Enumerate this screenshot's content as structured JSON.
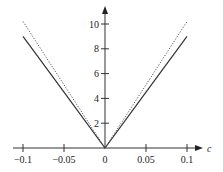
{
  "chart_data": {
    "type": "line",
    "title": "",
    "xlabel": "c",
    "ylabel": "",
    "xlim": [
      -0.11,
      0.12
    ],
    "ylim": [
      0,
      11
    ],
    "grid": false,
    "legend": null,
    "x_ticks": [
      -0.1,
      -0.05,
      0,
      0.05,
      0.1
    ],
    "x_tick_labels": [
      "−0.1",
      "−0.05",
      "0",
      "0.05",
      "0.1"
    ],
    "y_ticks": [
      2,
      4,
      6,
      8,
      10
    ],
    "y_tick_labels": [
      "2",
      "4",
      "6",
      "8",
      "10"
    ],
    "series": [
      {
        "name": "solid",
        "style": "solid",
        "color": "#333333",
        "x": [
          -0.1,
          -0.05,
          0,
          0.05,
          0.1
        ],
        "y": [
          9.0,
          4.5,
          0,
          4.5,
          9.0
        ]
      },
      {
        "name": "dotted",
        "style": "dotted",
        "color": "#555555",
        "x": [
          -0.1,
          -0.05,
          0,
          0.05,
          0.1
        ],
        "y": [
          10.2,
          5.1,
          0,
          5.1,
          10.2
        ]
      }
    ]
  },
  "axes": {
    "x_label": "c"
  }
}
